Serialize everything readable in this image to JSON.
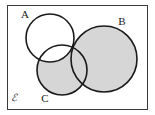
{
  "figure": {
    "kind": "venn-diagram",
    "width": 155,
    "height": 115,
    "background_color": "#ffffff"
  },
  "universe": {
    "label": "ℰ",
    "label_x": 14,
    "label_y": 101,
    "rect": {
      "x": 7,
      "y": 5,
      "width": 141,
      "height": 105
    },
    "border_color": "#3a3a3a",
    "border_width": 1,
    "fill_color": "#ffffff"
  },
  "shading": {
    "description": "Region (B union C) minus A is shaded",
    "fill_color": "#d6d6d6",
    "unshaded_color": "#ffffff"
  },
  "sets": [
    {
      "id": "A",
      "label": "A",
      "cx": 50,
      "cy": 38,
      "r": 24,
      "shaded": false,
      "stroke_color": "#1a1a1a",
      "stroke_width": 1.6,
      "label_x": 25,
      "label_y": 18
    },
    {
      "id": "B",
      "label": "B",
      "cx": 104,
      "cy": 59,
      "r": 33,
      "shaded": true,
      "stroke_color": "#1a1a1a",
      "stroke_width": 1.6,
      "label_x": 122,
      "label_y": 25
    },
    {
      "id": "C",
      "label": "C",
      "cx": 62,
      "cy": 70,
      "r": 25,
      "shaded": true,
      "stroke_color": "#1a1a1a",
      "stroke_width": 1.6,
      "label_x": 45,
      "label_y": 102
    }
  ]
}
